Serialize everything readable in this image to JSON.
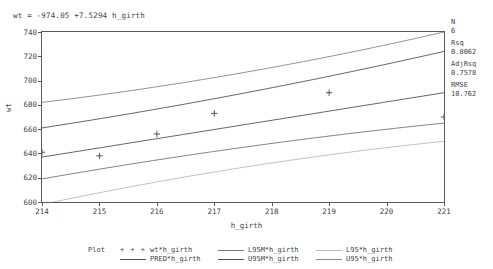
{
  "equation": "wt = -974.05 +7.5294 h_girth",
  "stats": [
    {
      "label": "N",
      "value": "6"
    },
    {
      "label": "Rsq",
      "value": "0.8062"
    },
    {
      "label": "AdjRsq",
      "value": "0.7578"
    },
    {
      "label": "RMSE",
      "value": "10.762"
    }
  ],
  "legend": {
    "title": "Plot",
    "items": [
      {
        "label": "wt*h_girth",
        "key": "+ + +",
        "type": "marker",
        "color": "#444444"
      },
      {
        "label": "PRED*h_girth",
        "key": "line",
        "type": "line",
        "color": "#555555"
      },
      {
        "label": "L95M*h_girth",
        "key": "line",
        "type": "line",
        "color": "#777777"
      },
      {
        "label": "U95M*h_girth",
        "key": "line",
        "type": "line",
        "color": "#555555"
      },
      {
        "label": "L95*h_girth",
        "key": "line",
        "type": "line",
        "color": "#bbbbbb"
      },
      {
        "label": "U95*h_girth",
        "key": "line",
        "type": "line",
        "color": "#888888"
      }
    ]
  },
  "chart_data": {
    "type": "scatter",
    "title": "",
    "xlabel": "h_girth",
    "ylabel": "wt",
    "xlim": [
      214,
      221
    ],
    "ylim": [
      600,
      740
    ],
    "xticks": [
      214,
      215,
      216,
      217,
      218,
      219,
      220,
      221
    ],
    "yticks": [
      600,
      620,
      640,
      660,
      680,
      700,
      720,
      740
    ],
    "grid": false,
    "legend_position": "bottom",
    "regression": {
      "intercept": -974.05,
      "slope": 7.5294
    },
    "observed": {
      "name": "wt*h_girth",
      "marker": "+",
      "x": [
        214,
        215,
        216,
        217,
        219,
        221
      ],
      "y": [
        641,
        638,
        656,
        673,
        690,
        670
      ]
    },
    "series": [
      {
        "name": "U95*h_girth",
        "color": "#888888",
        "x": [
          214,
          221
        ],
        "y": [
          679,
          737
        ]
      },
      {
        "name": "U95M*h_girth",
        "color": "#555555",
        "x": [
          214,
          221
        ],
        "y": [
          659,
          722
        ]
      },
      {
        "name": "PRED*h_girth",
        "color": "#555555",
        "x": [
          214,
          221
        ],
        "y": [
          637,
          690
        ]
      },
      {
        "name": "L95M*h_girth",
        "color": "#777777",
        "x": [
          214,
          221
        ],
        "y": [
          621,
          667
        ]
      },
      {
        "name": "L95*h_girth",
        "color": "#bbbbbb",
        "x": [
          214,
          221
        ],
        "y": [
          601,
          653
        ]
      }
    ]
  }
}
